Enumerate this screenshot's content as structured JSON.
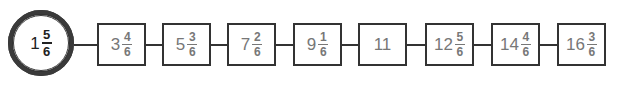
{
  "diagram": {
    "colors": {
      "stroke": "#333333",
      "start_text": "#222222",
      "box_text": "#777777",
      "background": "#ffffff"
    },
    "start": {
      "whole": "1",
      "num": "5",
      "den": "6",
      "shape": "double-circle"
    },
    "boxes": [
      {
        "whole": "3",
        "num": "4",
        "den": "6"
      },
      {
        "whole": "5",
        "num": "3",
        "den": "6"
      },
      {
        "whole": "7",
        "num": "2",
        "den": "6"
      },
      {
        "whole": "9",
        "num": "1",
        "den": "6"
      },
      {
        "whole": "11",
        "num": null,
        "den": null
      },
      {
        "whole": "12",
        "num": "5",
        "den": "6"
      },
      {
        "whole": "14",
        "num": "4",
        "den": "6"
      },
      {
        "whole": "16",
        "num": "3",
        "den": "6"
      }
    ]
  }
}
